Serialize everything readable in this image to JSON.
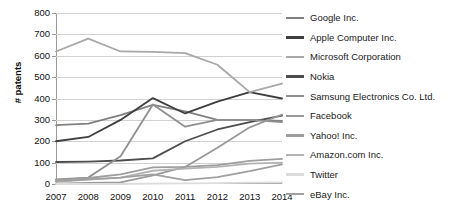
{
  "chart_data": {
    "type": "line",
    "title": "",
    "xlabel": "",
    "ylabel": "# patents",
    "categories": [
      "2007",
      "2008",
      "2009",
      "2010",
      "2011",
      "2012",
      "2013",
      "2014"
    ],
    "x": [
      2007,
      2008,
      2009,
      2010,
      2011,
      2012,
      2013,
      2014
    ],
    "ylim": [
      0,
      800
    ],
    "yticks": [
      0,
      100,
      200,
      300,
      400,
      500,
      600,
      700,
      800
    ],
    "grid": true,
    "legend_position": "right",
    "series": [
      {
        "name": "Google Inc.",
        "color": "#808080",
        "values": [
          275,
          282,
          322,
          370,
          340,
          300,
          300,
          295
        ]
      },
      {
        "name": "Apple Computer Inc.",
        "color": "#3f3f3f",
        "values": [
          200,
          220,
          300,
          402,
          330,
          385,
          430,
          400
        ]
      },
      {
        "name": "Microsoft Corporation",
        "color": "#a8a8a8",
        "values": [
          620,
          680,
          620,
          618,
          612,
          558,
          430,
          470
        ]
      },
      {
        "name": "Nokia",
        "color": "#4d4d4d",
        "values": [
          103,
          105,
          110,
          120,
          200,
          255,
          290,
          320
        ]
      },
      {
        "name": "Samsung Electronics Co. Ltd.",
        "color": "#8f8f8f",
        "values": [
          22,
          30,
          130,
          372,
          268,
          300,
          300,
          290
        ]
      },
      {
        "name": "Facebook",
        "color": "#999999",
        "values": [
          2,
          5,
          8,
          40,
          80,
          170,
          265,
          325
        ]
      },
      {
        "name": "Yahoo! Inc.",
        "color": "#9e9e9e",
        "values": [
          18,
          28,
          45,
          78,
          80,
          88,
          108,
          118
        ]
      },
      {
        "name": "Amazon.com Inc.",
        "color": "#b3b3b3",
        "values": [
          10,
          20,
          30,
          62,
          72,
          80,
          95,
          100
        ]
      },
      {
        "name": "Twitter",
        "color": "#dcdcdc",
        "values": [
          0,
          0,
          0,
          2,
          3,
          4,
          6,
          8
        ]
      },
      {
        "name": "eBay Inc.",
        "color": "#a0a0a0",
        "values": [
          14,
          22,
          30,
          45,
          18,
          32,
          60,
          92
        ]
      }
    ]
  },
  "legend": {
    "items": [
      {
        "label": "Google Inc."
      },
      {
        "label": "Apple Computer Inc."
      },
      {
        "label": "Microsoft Corporation"
      },
      {
        "label": "Nokia"
      },
      {
        "label": "Samsung Electronics Co. Ltd."
      },
      {
        "label": "Facebook"
      },
      {
        "label": "Yahoo! Inc."
      },
      {
        "label": "Amazon.com Inc."
      },
      {
        "label": "Twitter"
      },
      {
        "label": "eBay Inc."
      }
    ]
  }
}
